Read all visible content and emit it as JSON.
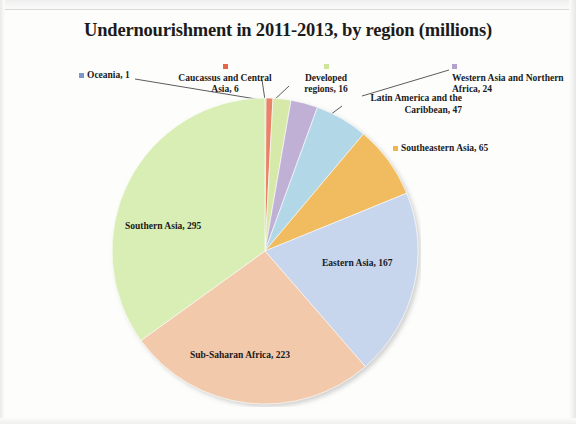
{
  "chart_data": {
    "type": "pie",
    "title": "Undernourishment in 2011-2013, by region (millions)",
    "unit": "millions",
    "total": 844,
    "categories": [
      "Oceania",
      "Caucassus and Central Asia",
      "Developed regions",
      "Western Asia and Northern Africa",
      "Latin America and the Caribbean",
      "Southeastern Asia",
      "Eastern Asia",
      "Sub-Saharan Africa",
      "Southern Asia"
    ],
    "values": [
      1,
      6,
      16,
      24,
      47,
      65,
      167,
      223,
      295
    ],
    "colors": [
      "#8fa9d8",
      "#e8836a",
      "#d6e9a8",
      "#c0b0d6",
      "#b2d8e8",
      "#f0bc5e",
      "#c7d5ed",
      "#f2c9ab",
      "#d9eeb4"
    ],
    "slices": [
      {
        "label": "Oceania",
        "value": 1,
        "color": "#8fa9d8",
        "marker_color": "#7b96c8",
        "label_text": "Oceania, 1",
        "placement": "callout"
      },
      {
        "label": "Caucassus and Central Asia",
        "value": 6,
        "color": "#e8836a",
        "marker_color": "#e4674a",
        "label_text": "Caucassus and Central Asia, 6",
        "placement": "callout"
      },
      {
        "label": "Developed regions",
        "value": 16,
        "color": "#d6e9a8",
        "marker_color": "#cfe59a",
        "label_text": "Developed regions, 16",
        "placement": "callout"
      },
      {
        "label": "Western Asia and Northern Africa",
        "value": 24,
        "color": "#c0b0d6",
        "marker_color": "#b3a2cd",
        "label_text": "Western Asia and Northern Africa, 24",
        "placement": "callout"
      },
      {
        "label": "Latin America and the Caribbean",
        "value": 47,
        "color": "#b2d8e8",
        "marker_color": "#92c8de",
        "label_text": "Latin America and the Caribbean, 47",
        "placement": "callout"
      },
      {
        "label": "Southeastern Asia",
        "value": 65,
        "color": "#f0bc5e",
        "marker_color": "#edb54e",
        "label_text": "Southeastern Asia, 65",
        "placement": "callout"
      },
      {
        "label": "Eastern Asia",
        "value": 167,
        "color": "#c7d5ed",
        "marker_color": "#c7d5ed",
        "label_text": "Eastern Asia, 167",
        "placement": "inside"
      },
      {
        "label": "Sub-Saharan Africa",
        "value": 223,
        "color": "#f2c9ab",
        "marker_color": "#f2c9ab",
        "label_text": "Sub-Saharan Africa, 223",
        "placement": "inside"
      },
      {
        "label": "Southern Asia",
        "value": 295,
        "color": "#d9eeb4",
        "marker_color": "#d9eeb4",
        "label_text": "Southern Asia, 295",
        "placement": "inside"
      }
    ],
    "legend": "none",
    "grid": false,
    "start_angle_deg": 0,
    "direction": "clockwise"
  },
  "labels": {
    "oceania": "Oceania, 1",
    "caucassus": "Caucassus and Central Asia, 6",
    "developed": "Developed regions, 16",
    "western": "Western Asia and Northern Africa, 24",
    "latin": "Latin America and the Caribbean, 47",
    "southeastern": "Southeastern Asia, 65",
    "eastern": "Eastern Asia, 167",
    "subsaharan": "Sub-Saharan Africa, 223",
    "southern": "Southern Asia, 295"
  }
}
